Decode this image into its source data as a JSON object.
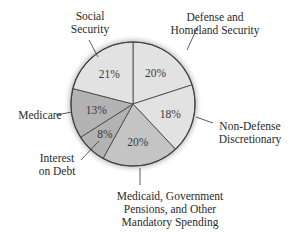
{
  "chart_data": {
    "type": "pie",
    "title": "",
    "start_angle_deg": 0,
    "direction": "clockwise",
    "slices": [
      {
        "label_lines": [
          "Defense and",
          "Homeland Security"
        ],
        "value": 20,
        "value_label": "20%",
        "color": "#e2e2e2"
      },
      {
        "label_lines": [
          "Non-Defense",
          "Discretionary"
        ],
        "value": 18,
        "value_label": "18%",
        "color": "#e2e2e2"
      },
      {
        "label_lines": [
          "Medicaid, Government",
          "Pensions, and Other",
          "Mandatory Spending"
        ],
        "value": 20,
        "value_label": "20%",
        "color": "#c4c4c4"
      },
      {
        "label_lines": [
          "Interest",
          "on Debt"
        ],
        "value": 8,
        "value_label": "8%",
        "color": "#b3b3b3"
      },
      {
        "label_lines": [
          "Medicare"
        ],
        "value": 13,
        "value_label": "13%",
        "color": "#b3b3b3"
      },
      {
        "label_lines": [
          "Social",
          "Security"
        ],
        "value": 21,
        "value_label": "21%",
        "color": "#e2e2e2"
      }
    ]
  }
}
